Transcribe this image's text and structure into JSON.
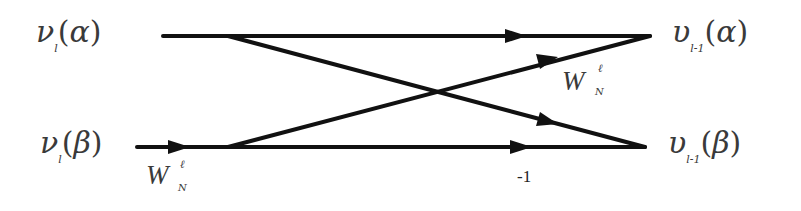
{
  "diagram": {
    "type": "butterfly",
    "inputs": [
      {
        "symbol": "ν",
        "subscript": "l",
        "argument": "α"
      },
      {
        "symbol": "ν",
        "subscript": "l",
        "argument": "β"
      }
    ],
    "outputs": [
      {
        "symbol": "υ",
        "subscript": "l-1",
        "argument": "α"
      },
      {
        "symbol": "υ",
        "subscript": "l-1",
        "argument": "β"
      }
    ],
    "twiddle_factors": [
      {
        "base": "W",
        "superscript": "ℓ",
        "subscript": "N",
        "location": "input-beta"
      },
      {
        "base": "W",
        "superscript": "ℓ",
        "subscript": "N",
        "location": "cross-to-alpha"
      }
    ],
    "multiplier": "-1",
    "edges": [
      {
        "from": "input-alpha",
        "to": "output-alpha"
      },
      {
        "from": "input-alpha",
        "to": "output-beta"
      },
      {
        "from": "input-beta",
        "to": "output-alpha"
      },
      {
        "from": "input-beta",
        "to": "output-beta"
      }
    ],
    "line_color": "#111111",
    "text_color": "#3a3a3a"
  }
}
